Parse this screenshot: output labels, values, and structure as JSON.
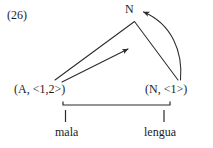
{
  "figure": {
    "example_number": "(26)",
    "type": "syntactic-feature-checking-diagram",
    "stroke_color": "#2b2b2b",
    "background_color": "#ffffff"
  },
  "nodes": {
    "top": {
      "label": "N",
      "name": "top-node-n"
    },
    "left": {
      "label": "(A, <1,2>)",
      "name": "left-node-adjective"
    },
    "right": {
      "label": "(N, <1>)",
      "name": "right-node-noun"
    }
  },
  "words": {
    "left": "mala",
    "right": "lengua"
  },
  "edges": [
    {
      "name": "triangle-left-leg",
      "from": "left-node",
      "to": "top-node",
      "style": "straight",
      "arrowhead": false
    },
    {
      "name": "triangle-right-leg",
      "from": "right-node",
      "to": "top-node",
      "style": "straight",
      "arrowhead": false
    },
    {
      "name": "inner-movement-arrow",
      "from": "left-node",
      "to": "apex-region",
      "style": "straight",
      "arrowhead": true
    },
    {
      "name": "curved-agreement-arrow",
      "from": "right-node",
      "to": "top-node",
      "style": "curved",
      "arrowhead": true
    }
  ],
  "bracket": {
    "name": "spanning-bracket",
    "spans": [
      "left-node",
      "right-node"
    ]
  }
}
